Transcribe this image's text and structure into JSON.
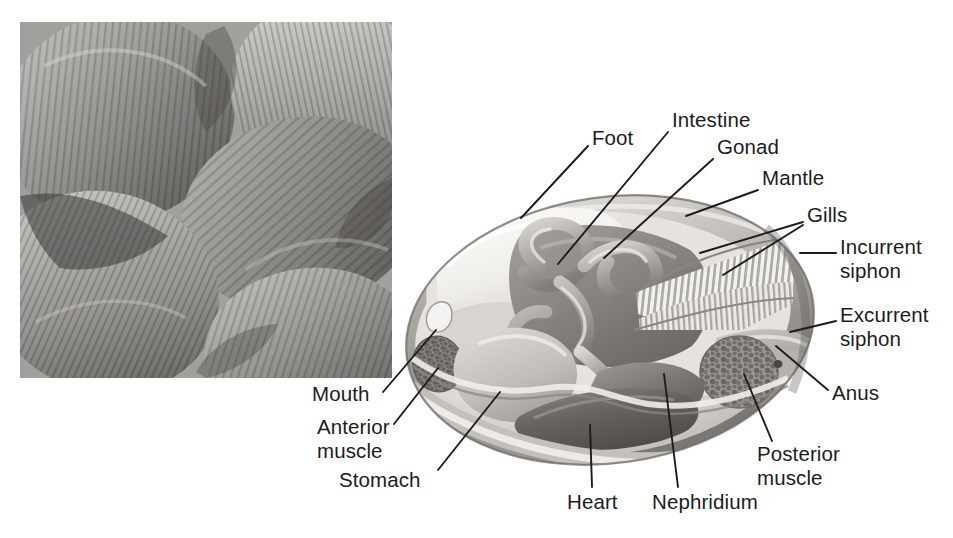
{
  "figure": {
    "background_color": "#ffffff",
    "label_color": "#1c1c1c",
    "leader_line_color": "#1c1c1c",
    "width": 953,
    "height": 538
  },
  "photo": {
    "name": "clam-shells-photograph",
    "description": "Grayscale close-up photograph of a pile of clam shells showing concentric growth rings",
    "x": 20,
    "y": 22,
    "width": 372,
    "height": 356
  },
  "diagram": {
    "name": "clam-cutaway-illustration",
    "center_x": 610,
    "center_y": 330,
    "width": 420,
    "height": 270
  },
  "labels": [
    {
      "id": "foot",
      "text": "Foot",
      "x": 592,
      "y": 136,
      "align": "left",
      "lines": 1
    },
    {
      "id": "intestine",
      "text": "Intestine",
      "x": 672,
      "y": 118,
      "align": "left",
      "lines": 1
    },
    {
      "id": "gonad",
      "text": "Gonad",
      "x": 717,
      "y": 145,
      "align": "left",
      "lines": 1
    },
    {
      "id": "mantle",
      "text": "Mantle",
      "x": 762,
      "y": 176,
      "align": "left",
      "lines": 1
    },
    {
      "id": "gills",
      "text": "Gills",
      "x": 807,
      "y": 213,
      "align": "left",
      "lines": 1
    },
    {
      "id": "incurrent-siphon",
      "text": "Incurrent\nsiphon",
      "x": 840,
      "y": 245,
      "align": "left",
      "lines": 2
    },
    {
      "id": "excurrent-siphon",
      "text": "Excurrent\nsiphon",
      "x": 840,
      "y": 310,
      "align": "left",
      "lines": 2
    },
    {
      "id": "anus",
      "text": "Anus",
      "x": 832,
      "y": 396,
      "align": "left",
      "lines": 1
    },
    {
      "id": "posterior-muscle",
      "text": "Posterior\nmuscle",
      "x": 757,
      "y": 452,
      "align": "left",
      "lines": 2
    },
    {
      "id": "nephridium",
      "text": "Nephridium",
      "x": 652,
      "y": 500,
      "align": "left",
      "lines": 1
    },
    {
      "id": "heart",
      "text": "Heart",
      "x": 567,
      "y": 500,
      "align": "left",
      "lines": 1
    },
    {
      "id": "stomach",
      "text": "Stomach",
      "x": 339,
      "y": 478,
      "align": "left",
      "lines": 1
    },
    {
      "id": "anterior-muscle",
      "text": "Anterior\nmuscle",
      "x": 317,
      "y": 425,
      "align": "left",
      "lines": 2
    },
    {
      "id": "mouth",
      "text": "Mouth",
      "x": 312,
      "y": 392,
      "align": "left",
      "lines": 1
    }
  ],
  "structures": [
    {
      "id": "shell",
      "label": "shell"
    },
    {
      "id": "mantle",
      "label": "mantle"
    },
    {
      "id": "foot",
      "label": "foot"
    },
    {
      "id": "intestine",
      "label": "intestine"
    },
    {
      "id": "gonad",
      "label": "gonad"
    },
    {
      "id": "gills",
      "label": "gills"
    },
    {
      "id": "incurrent-siphon",
      "label": "incurrent siphon"
    },
    {
      "id": "excurrent-siphon",
      "label": "excurrent siphon"
    },
    {
      "id": "anus",
      "label": "anus"
    },
    {
      "id": "posterior-muscle",
      "label": "posterior adductor muscle"
    },
    {
      "id": "anterior-muscle",
      "label": "anterior adductor muscle"
    },
    {
      "id": "nephridium",
      "label": "nephridium"
    },
    {
      "id": "heart",
      "label": "heart"
    },
    {
      "id": "stomach",
      "label": "stomach"
    },
    {
      "id": "mouth",
      "label": "mouth"
    }
  ],
  "palette": {
    "shell_outer": "#b9b6b1",
    "shell_mid": "#8f8c88",
    "shell_inner": "#d6d3cf",
    "mantle": "#c9c6c2",
    "foot": "#efeeea",
    "body_pale": "#ddd9d4",
    "organ_dark": "#7d7a76",
    "organ_mid": "#a29f9a",
    "heart_dark": "#6b6864",
    "gill_stripe": "#f4f3f0",
    "muscle_stipple": "#86837f",
    "photo_gray": "#9a9a9a"
  }
}
